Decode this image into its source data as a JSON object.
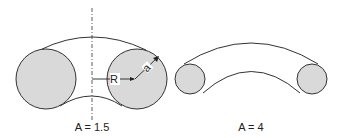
{
  "figures": [
    {
      "id": "left",
      "aspect_label": "A = 1.5",
      "radius_label": "R",
      "minor_radius_label": "a"
    },
    {
      "id": "right",
      "aspect_label": "A = 4"
    }
  ],
  "colors": {
    "fill": "#d9d9d9",
    "stroke": "#333333",
    "background": "#ffffff"
  }
}
